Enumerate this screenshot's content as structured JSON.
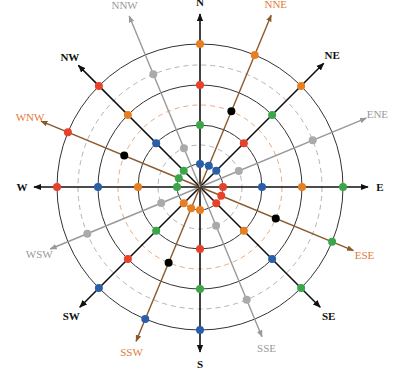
{
  "diagram": {
    "type": "compass-rose",
    "center": [
      200,
      187
    ],
    "rings": [
      {
        "r": 23,
        "style": "solid",
        "color": "#333333"
      },
      {
        "r": 42,
        "style": "dashed",
        "color": "#aaaaaa"
      },
      {
        "r": 62,
        "style": "solid",
        "color": "#333333"
      },
      {
        "r": 82,
        "style": "dashed",
        "color": "#e8a070"
      },
      {
        "r": 102,
        "style": "solid",
        "color": "#333333"
      },
      {
        "r": 122,
        "style": "dashed",
        "color": "#aaaaaa"
      },
      {
        "r": 143,
        "style": "solid",
        "color": "#333333"
      }
    ],
    "colors": {
      "orange": "#e67e22",
      "red": "#e8402a",
      "green": "#3aa64a",
      "blue": "#2a5fa8",
      "gray": "#aaaaaa",
      "black": "#000000"
    },
    "directions": [
      {
        "label": "N",
        "angle": 90,
        "len": 173,
        "line": "#111111",
        "text": "#111111",
        "bold": true,
        "points": [
          {
            "r": 143,
            "c": "orange"
          },
          {
            "r": 102,
            "c": "red"
          },
          {
            "r": 62,
            "c": "green"
          },
          {
            "r": 23,
            "c": "blue"
          }
        ]
      },
      {
        "label": "NNE",
        "angle": 67.5,
        "len": 186,
        "line": "#8b5a2b",
        "text": "#e07b39",
        "bold": false,
        "points": [
          {
            "r": 143,
            "c": "orange"
          },
          {
            "r": 82,
            "c": "black"
          },
          {
            "r": 23,
            "c": "blue"
          }
        ]
      },
      {
        "label": "NE",
        "angle": 45,
        "len": 175,
        "line": "#111111",
        "text": "#111111",
        "bold": true,
        "points": [
          {
            "r": 143,
            "c": "orange"
          },
          {
            "r": 102,
            "c": "green"
          },
          {
            "r": 62,
            "c": "red"
          },
          {
            "r": 23,
            "c": "blue"
          }
        ]
      },
      {
        "label": "ENE",
        "angle": 22.5,
        "len": 180,
        "line": "#999999",
        "text": "#999999",
        "bold": false,
        "points": [
          {
            "r": 122,
            "c": "gray"
          },
          {
            "r": 42,
            "c": "gray"
          }
        ]
      },
      {
        "label": "E",
        "angle": 0,
        "len": 168,
        "line": "#111111",
        "text": "#111111",
        "bold": true,
        "points": [
          {
            "r": 143,
            "c": "green"
          },
          {
            "r": 102,
            "c": "orange"
          },
          {
            "r": 62,
            "c": "blue"
          },
          {
            "r": 23,
            "c": "red"
          }
        ]
      },
      {
        "label": "ESE",
        "angle": -22.5,
        "len": 166,
        "line": "#8b5a2b",
        "text": "#e07b39",
        "bold": false,
        "points": [
          {
            "r": 143,
            "c": "green"
          },
          {
            "r": 82,
            "c": "black"
          },
          {
            "r": 23,
            "c": "red"
          }
        ]
      },
      {
        "label": "SE",
        "angle": -45,
        "len": 170,
        "line": "#111111",
        "text": "#111111",
        "bold": true,
        "points": [
          {
            "r": 143,
            "c": "green"
          },
          {
            "r": 102,
            "c": "blue"
          },
          {
            "r": 62,
            "c": "orange"
          },
          {
            "r": 23,
            "c": "red"
          }
        ]
      },
      {
        "label": "SSE",
        "angle": -67.5,
        "len": 162,
        "line": "#999999",
        "text": "#999999",
        "bold": false,
        "points": [
          {
            "r": 122,
            "c": "gray"
          },
          {
            "r": 42,
            "c": "gray"
          }
        ]
      },
      {
        "label": "S",
        "angle": -90,
        "len": 165,
        "line": "#111111",
        "text": "#111111",
        "bold": true,
        "points": [
          {
            "r": 143,
            "c": "blue"
          },
          {
            "r": 102,
            "c": "green"
          },
          {
            "r": 62,
            "c": "red"
          },
          {
            "r": 23,
            "c": "orange"
          }
        ]
      },
      {
        "label": "SSW",
        "angle": -112.5,
        "len": 167,
        "line": "#8b5a2b",
        "text": "#e07b39",
        "bold": false,
        "points": [
          {
            "r": 143,
            "c": "blue"
          },
          {
            "r": 82,
            "c": "black"
          },
          {
            "r": 23,
            "c": "orange"
          }
        ]
      },
      {
        "label": "SW",
        "angle": -135,
        "len": 170,
        "line": "#111111",
        "text": "#111111",
        "bold": true,
        "points": [
          {
            "r": 143,
            "c": "blue"
          },
          {
            "r": 102,
            "c": "red"
          },
          {
            "r": 62,
            "c": "green"
          },
          {
            "r": 23,
            "c": "orange"
          }
        ]
      },
      {
        "label": "WSW",
        "angle": -157.5,
        "len": 162,
        "line": "#999999",
        "text": "#999999",
        "bold": false,
        "points": [
          {
            "r": 122,
            "c": "gray"
          },
          {
            "r": 42,
            "c": "gray"
          }
        ]
      },
      {
        "label": "W",
        "angle": 180,
        "len": 166,
        "line": "#111111",
        "text": "#111111",
        "bold": true,
        "points": [
          {
            "r": 143,
            "c": "red"
          },
          {
            "r": 102,
            "c": "blue"
          },
          {
            "r": 62,
            "c": "orange"
          },
          {
            "r": 23,
            "c": "green"
          }
        ]
      },
      {
        "label": "WNW",
        "angle": 157.5,
        "len": 172,
        "line": "#8b5a2b",
        "text": "#e07b39",
        "bold": false,
        "points": [
          {
            "r": 143,
            "c": "red"
          },
          {
            "r": 82,
            "c": "black"
          },
          {
            "r": 23,
            "c": "green"
          }
        ]
      },
      {
        "label": "NW",
        "angle": 135,
        "len": 172,
        "line": "#111111",
        "text": "#111111",
        "bold": true,
        "points": [
          {
            "r": 143,
            "c": "red"
          },
          {
            "r": 102,
            "c": "orange"
          },
          {
            "r": 62,
            "c": "blue"
          },
          {
            "r": 23,
            "c": "green"
          }
        ]
      },
      {
        "label": "NNW",
        "angle": 112.5,
        "len": 185,
        "line": "#999999",
        "text": "#999999",
        "bold": false,
        "points": [
          {
            "r": 122,
            "c": "gray"
          },
          {
            "r": 42,
            "c": "gray"
          }
        ]
      }
    ]
  }
}
